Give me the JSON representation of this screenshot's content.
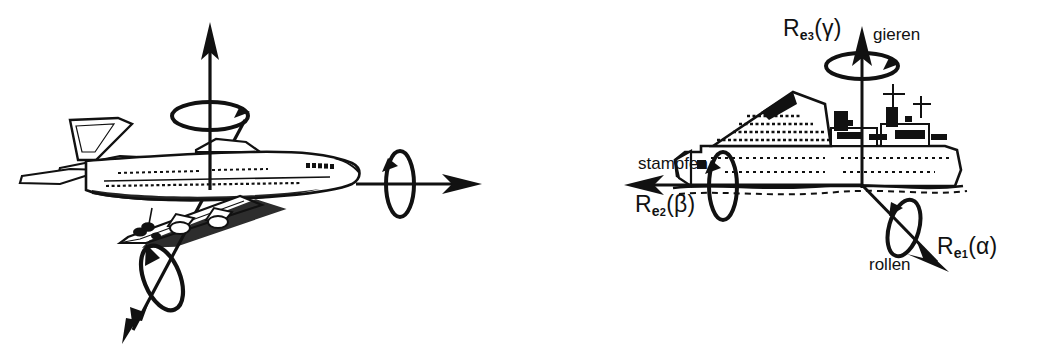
{
  "figure": {
    "title_visible": false,
    "background_color": "#ffffff",
    "ink_color": "#111111"
  },
  "panels": [
    {
      "id": "aircraft",
      "vehicle": "airliner-side-view",
      "origin": {
        "x": 210,
        "y": 185
      },
      "axes": [
        {
          "name": "vertical-axis",
          "direction": "up",
          "tip": {
            "x": 210,
            "y": 25
          },
          "rotation_marker": "horizontal-ellipse-arrow"
        },
        {
          "name": "longitudinal-axis",
          "direction": "right",
          "tip": {
            "x": 480,
            "y": 185
          },
          "rotation_marker": "vertical-ellipse-arrow"
        },
        {
          "name": "lateral-axis",
          "direction": "down-left",
          "tip": {
            "x": 122,
            "y": 340
          },
          "rotation_marker": "tilted-ellipse-arrow"
        }
      ]
    },
    {
      "id": "ship",
      "vehicle": "ship-side-view",
      "origin": {
        "x": 862,
        "y": 185
      },
      "axes": [
        {
          "name": "vertical-axis",
          "direction": "up",
          "tip": {
            "x": 862,
            "y": 28
          },
          "rotation_marker": "horizontal-ellipse-arrow"
        },
        {
          "name": "longitudinal-axis",
          "direction": "left",
          "tip": {
            "x": 624,
            "y": 185
          },
          "rotation_marker": "vertical-ellipse-arrow"
        },
        {
          "name": "lateral-axis",
          "direction": "down-right",
          "tip": {
            "x": 948,
            "y": 272
          },
          "rotation_marker": "tilted-ellipse-arrow"
        }
      ]
    }
  ],
  "labels": {
    "yaw": {
      "rotation_symbol": {
        "R": "R",
        "axis": "e",
        "index": "3",
        "angle": "γ",
        "open": "(",
        "close": ")"
      },
      "rotation_text": "R",
      "name": "gieren"
    },
    "pitch": {
      "rotation_symbol": {
        "R": "R",
        "axis": "e",
        "index": "2",
        "angle": "β",
        "open": "(",
        "close": ")"
      },
      "rotation_text": "R",
      "name": "stampfen"
    },
    "roll": {
      "rotation_symbol": {
        "R": "R",
        "axis": "e",
        "index": "1",
        "angle": "α",
        "open": "(",
        "close": ")"
      },
      "rotation_text": "R",
      "name": "rollen"
    }
  }
}
